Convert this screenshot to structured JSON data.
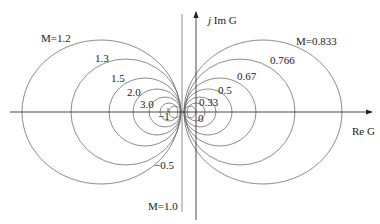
{
  "diagram": {
    "axes": {
      "real_label": "Re G",
      "imag_label_prefix": "j",
      "imag_label": "Im G"
    },
    "markers": {
      "minus_one": "−1",
      "zero": "0"
    },
    "left_circles": [
      {
        "label": "M=1.2",
        "M": 1.2
      },
      {
        "label": "1.3",
        "M": 1.3
      },
      {
        "label": "1.5",
        "M": 1.5
      },
      {
        "label": "2.0",
        "M": 2.0
      },
      {
        "label": "3.0",
        "M": 3.0
      }
    ],
    "right_circles": [
      {
        "label": "M=0.833",
        "M": 0.833
      },
      {
        "label": "0.766",
        "M": 0.766
      },
      {
        "label": "0.67",
        "M": 0.67
      },
      {
        "label": "0.5",
        "M": 0.5
      },
      {
        "label": "0.33",
        "M": 0.33
      }
    ],
    "vertical_line": {
      "label": "M=1.0",
      "M": 1.0
    },
    "extra_label": "−0.5",
    "colors": {
      "curves": "#6e6e6e",
      "axes": "#333333",
      "text": "#222222"
    }
  }
}
